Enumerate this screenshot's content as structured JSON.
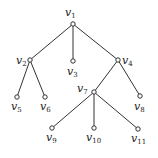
{
  "diagram": {
    "type": "rooted-tree",
    "nodes": [
      {
        "id": "v1",
        "base": "v",
        "sub": "1",
        "x": 73,
        "y": 24,
        "lx": 65,
        "ly": 16,
        "anchor": "start"
      },
      {
        "id": "v2",
        "base": "v",
        "sub": "2",
        "x": 30,
        "y": 60,
        "lx": 16,
        "ly": 64,
        "anchor": "start"
      },
      {
        "id": "v3",
        "base": "v",
        "sub": "3",
        "x": 73,
        "y": 61,
        "lx": 67,
        "ly": 75,
        "anchor": "start"
      },
      {
        "id": "v4",
        "base": "v",
        "sub": "4",
        "x": 118,
        "y": 60,
        "lx": 122,
        "ly": 64,
        "anchor": "start"
      },
      {
        "id": "v5",
        "base": "v",
        "sub": "5",
        "x": 17,
        "y": 97,
        "lx": 11,
        "ly": 110,
        "anchor": "start"
      },
      {
        "id": "v6",
        "base": "v",
        "sub": "6",
        "x": 45,
        "y": 97,
        "lx": 40,
        "ly": 110,
        "anchor": "start"
      },
      {
        "id": "v7",
        "base": "v",
        "sub": "7",
        "x": 94,
        "y": 92,
        "lx": 77,
        "ly": 92,
        "anchor": "start"
      },
      {
        "id": "v8",
        "base": "v",
        "sub": "8",
        "x": 140,
        "y": 96,
        "lx": 134,
        "ly": 110,
        "anchor": "start"
      },
      {
        "id": "v9",
        "base": "v",
        "sub": "9",
        "x": 52,
        "y": 128,
        "lx": 46,
        "ly": 141,
        "anchor": "start"
      },
      {
        "id": "v10",
        "base": "v",
        "sub": "10",
        "x": 94,
        "y": 128,
        "lx": 86,
        "ly": 141,
        "anchor": "start"
      },
      {
        "id": "v11",
        "base": "v",
        "sub": "11",
        "x": 138,
        "y": 129,
        "lx": 131,
        "ly": 142,
        "anchor": "start"
      }
    ],
    "edges": [
      [
        "v1",
        "v2"
      ],
      [
        "v1",
        "v3"
      ],
      [
        "v1",
        "v4"
      ],
      [
        "v2",
        "v5"
      ],
      [
        "v2",
        "v6"
      ],
      [
        "v4",
        "v7"
      ],
      [
        "v4",
        "v8"
      ],
      [
        "v7",
        "v9"
      ],
      [
        "v7",
        "v10"
      ],
      [
        "v7",
        "v11"
      ]
    ]
  }
}
